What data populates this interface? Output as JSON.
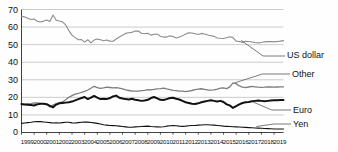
{
  "chart_data": {
    "type": "line",
    "title": "",
    "subtitle": "",
    "xlabel": "",
    "ylabel": "",
    "xlim": [
      1999,
      2019.75
    ],
    "ylim": [
      0,
      70
    ],
    "yticks": [
      0,
      10,
      20,
      30,
      40,
      50,
      60,
      70
    ],
    "grid": true,
    "legend_position": "inline-right",
    "x_tick_labels": [
      "1999",
      "2000",
      "2001",
      "2002",
      "2003",
      "2004",
      "2005",
      "2006",
      "2007",
      "2008",
      "2009",
      "2010",
      "2011",
      "2012",
      "2013",
      "2014",
      "2015",
      "2016",
      "2017",
      "2018",
      "2019"
    ],
    "x": [
      1999.0,
      1999.25,
      1999.5,
      1999.75,
      2000.0,
      2000.25,
      2000.5,
      2000.75,
      2001.0,
      2001.25,
      2001.5,
      2001.75,
      2002.0,
      2002.25,
      2002.5,
      2002.75,
      2003.0,
      2003.25,
      2003.5,
      2003.75,
      2004.0,
      2004.25,
      2004.5,
      2004.75,
      2005.0,
      2005.25,
      2005.5,
      2005.75,
      2006.0,
      2006.25,
      2006.5,
      2006.75,
      2007.0,
      2007.25,
      2007.5,
      2007.75,
      2008.0,
      2008.25,
      2008.5,
      2008.75,
      2009.0,
      2009.25,
      2009.5,
      2009.75,
      2010.0,
      2010.25,
      2010.5,
      2010.75,
      2011.0,
      2011.25,
      2011.5,
      2011.75,
      2012.0,
      2012.25,
      2012.5,
      2012.75,
      2013.0,
      2013.25,
      2013.5,
      2013.75,
      2014.0,
      2014.25,
      2014.5,
      2014.75,
      2015.0,
      2015.25,
      2015.5,
      2015.75,
      2016.0,
      2016.25,
      2016.5,
      2016.75,
      2017.0,
      2017.25,
      2017.5,
      2017.75,
      2018.0,
      2018.25,
      2018.5,
      2018.75,
      2019.0,
      2019.25,
      2019.5,
      2019.75
    ],
    "series": [
      {
        "name": "US dollar",
        "color": "#8c8c8c",
        "width": 1.1,
        "label_anchor_x": 2016.4,
        "label_anchor_y": 52.4,
        "values": [
          66.2,
          65.8,
          65.0,
          64.3,
          64.6,
          63.3,
          62.9,
          63.4,
          64.0,
          63.2,
          66.9,
          63.9,
          63.5,
          63.0,
          61.2,
          58.0,
          55.4,
          54.0,
          52.8,
          52.9,
          51.4,
          52.8,
          51.0,
          52.6,
          53.2,
          52.8,
          52.2,
          52.6,
          52.0,
          51.9,
          53.2,
          54.3,
          55.4,
          56.4,
          56.8,
          57.0,
          57.7,
          57.8,
          56.5,
          56.2,
          56.5,
          55.4,
          55.9,
          56.0,
          54.8,
          54.3,
          54.3,
          55.0,
          54.6,
          53.8,
          54.3,
          55.0,
          56.0,
          56.8,
          56.6,
          56.2,
          55.8,
          56.4,
          56.1,
          55.5,
          55.1,
          54.7,
          53.8,
          53.6,
          53.5,
          53.9,
          54.5,
          54.0,
          52.0,
          51.8,
          51.3,
          51.9,
          51.8,
          51.5,
          51.2,
          51.0,
          51.2,
          51.6,
          51.7,
          51.8,
          51.6,
          51.8,
          52.0,
          52.3
        ]
      },
      {
        "name": "Other",
        "color": "#7d7d7d",
        "width": 1.3,
        "label_anchor_x": 2015.9,
        "label_anchor_y": 28.3,
        "values": [
          15.8,
          16.0,
          16.3,
          16.4,
          16.8,
          16.9,
          16.6,
          16.4,
          15.9,
          14.6,
          15.6,
          16.4,
          17.0,
          17.4,
          18.6,
          20.0,
          21.0,
          21.8,
          22.2,
          22.9,
          23.4,
          24.2,
          25.2,
          26.3,
          25.6,
          25.1,
          25.4,
          25.8,
          25.6,
          25.4,
          25.5,
          25.2,
          24.8,
          24.2,
          23.9,
          23.6,
          23.5,
          23.6,
          23.8,
          24.0,
          24.4,
          24.2,
          24.5,
          24.8,
          25.0,
          25.3,
          24.8,
          24.4,
          24.0,
          23.8,
          23.6,
          23.5,
          23.3,
          23.6,
          23.9,
          24.4,
          24.7,
          24.9,
          24.6,
          24.2,
          24.1,
          24.3,
          24.7,
          25.2,
          25.4,
          25.0,
          26.0,
          28.2,
          27.8,
          26.5,
          25.8,
          25.6,
          25.9,
          26.2,
          26.0,
          25.8,
          25.7,
          25.8,
          26.0,
          25.9,
          25.8,
          25.9,
          26.0,
          26.0
        ]
      },
      {
        "name": "Euro",
        "color": "#111111",
        "width": 2.0,
        "label_anchor_x": 2017.3,
        "label_anchor_y": 17.5,
        "values": [
          16.2,
          16.0,
          15.8,
          15.6,
          15.4,
          16.0,
          16.4,
          16.4,
          16.1,
          15.2,
          14.3,
          15.9,
          16.6,
          16.8,
          17.0,
          17.2,
          17.6,
          18.3,
          19.0,
          19.6,
          20.2,
          19.0,
          19.8,
          20.8,
          19.8,
          19.0,
          19.2,
          19.0,
          19.6,
          20.5,
          21.0,
          19.8,
          19.4,
          19.0,
          18.8,
          19.2,
          18.6,
          18.4,
          18.0,
          18.2,
          18.6,
          19.6,
          20.2,
          19.4,
          18.6,
          18.5,
          19.0,
          19.6,
          19.8,
          19.2,
          18.8,
          18.0,
          17.2,
          16.8,
          16.4,
          16.2,
          16.6,
          17.2,
          17.6,
          18.0,
          18.4,
          18.0,
          17.6,
          18.0,
          17.4,
          16.0,
          15.4,
          14.0,
          15.0,
          16.0,
          16.8,
          17.2,
          17.4,
          17.8,
          18.0,
          18.2,
          18.0,
          17.8,
          18.0,
          18.2,
          18.3,
          18.4,
          18.5,
          18.5
        ]
      },
      {
        "name": "Yen",
        "color": "#111111",
        "width": 1.1,
        "label_anchor_x": 2017.6,
        "label_anchor_y": 3.4,
        "values": [
          5.2,
          5.4,
          5.6,
          5.8,
          6.1,
          6.3,
          6.2,
          6.0,
          5.8,
          5.6,
          5.4,
          5.5,
          5.4,
          5.6,
          5.8,
          5.8,
          5.5,
          5.4,
          5.6,
          5.8,
          6.0,
          5.9,
          5.7,
          5.5,
          5.2,
          4.8,
          4.4,
          4.2,
          4.0,
          3.9,
          3.8,
          3.6,
          3.4,
          3.2,
          3.0,
          3.0,
          3.2,
          3.3,
          3.4,
          3.5,
          3.6,
          3.4,
          3.3,
          3.2,
          3.1,
          3.3,
          3.6,
          3.8,
          3.9,
          3.8,
          3.6,
          3.5,
          3.6,
          3.8,
          4.0,
          4.0,
          4.2,
          4.3,
          4.4,
          4.4,
          4.3,
          4.2,
          4.0,
          3.8,
          3.6,
          3.5,
          3.4,
          3.3,
          3.2,
          3.1,
          3.0,
          2.9,
          2.8,
          2.7,
          2.6,
          2.5,
          2.4,
          2.3,
          2.2,
          2.1,
          2.0,
          2.0,
          2.0,
          2.0
        ]
      }
    ]
  },
  "axis": {
    "y_labels": [
      "70",
      "60",
      "50",
      "40",
      "30",
      "20",
      "10",
      "0"
    ],
    "x_labels": [
      "1999",
      "2000",
      "2001",
      "2002",
      "2003",
      "2004",
      "2005",
      "2006",
      "2007",
      "2008",
      "2009",
      "2010",
      "2011",
      "2012",
      "2013",
      "2014",
      "2015",
      "2016",
      "2017",
      "2018",
      "2019"
    ]
  },
  "labels": {
    "us_dollar": "US dollar",
    "other": "Other",
    "euro": "Euro",
    "yen": "Yen"
  },
  "style": {
    "background": "#fefefe",
    "grid_color": "#b4b4b4",
    "axis_color": "#2b2b2b",
    "us_dollar_color": "#8c8c8c",
    "other_color": "#7d7d7d",
    "euro_color": "#111111",
    "yen_color": "#111111"
  }
}
